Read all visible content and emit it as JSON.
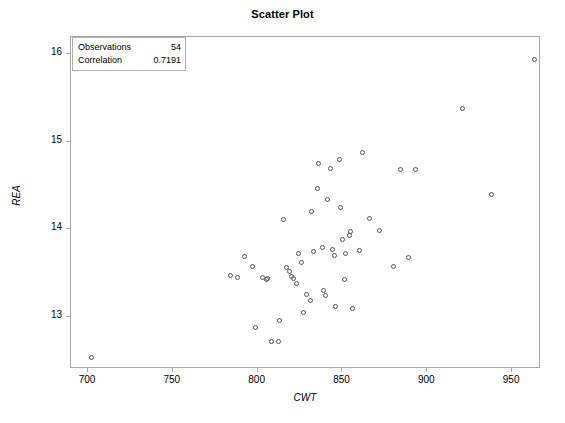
{
  "chart_data": {
    "type": "scatter",
    "title": "Scatter Plot",
    "xlabel": "CWT",
    "ylabel": "REA",
    "xlim": [
      690,
      967
    ],
    "ylim": [
      12.4,
      16.2
    ],
    "xticks": [
      700,
      750,
      800,
      850,
      900,
      950
    ],
    "yticks": [
      13,
      14,
      15,
      16
    ],
    "xtick_labels": [
      "700",
      "750",
      "800",
      "850",
      "900",
      "950"
    ],
    "ytick_labels": [
      "13",
      "14",
      "15",
      "16"
    ],
    "grid": false,
    "legend_position": "top-left",
    "marker": "open-circle",
    "marker_color": "#555555",
    "frame_color": "#a8a8a8",
    "points": [
      {
        "x": 702,
        "y": 12.53
      },
      {
        "x": 784,
        "y": 13.47
      },
      {
        "x": 788,
        "y": 13.45
      },
      {
        "x": 792,
        "y": 13.69
      },
      {
        "x": 797,
        "y": 13.57
      },
      {
        "x": 799,
        "y": 12.88
      },
      {
        "x": 803,
        "y": 13.45
      },
      {
        "x": 805,
        "y": 13.42
      },
      {
        "x": 806,
        "y": 13.44
      },
      {
        "x": 808,
        "y": 12.71
      },
      {
        "x": 812,
        "y": 12.72
      },
      {
        "x": 813,
        "y": 12.95
      },
      {
        "x": 815,
        "y": 14.11
      },
      {
        "x": 817,
        "y": 13.56
      },
      {
        "x": 819,
        "y": 13.52
      },
      {
        "x": 820,
        "y": 13.46
      },
      {
        "x": 821,
        "y": 13.44
      },
      {
        "x": 823,
        "y": 13.38
      },
      {
        "x": 824,
        "y": 13.72
      },
      {
        "x": 826,
        "y": 13.62
      },
      {
        "x": 827,
        "y": 13.05
      },
      {
        "x": 829,
        "y": 13.25
      },
      {
        "x": 831,
        "y": 13.18
      },
      {
        "x": 832,
        "y": 14.2
      },
      {
        "x": 833,
        "y": 13.74
      },
      {
        "x": 835,
        "y": 14.47
      },
      {
        "x": 836,
        "y": 14.75
      },
      {
        "x": 838,
        "y": 13.79
      },
      {
        "x": 839,
        "y": 13.3
      },
      {
        "x": 840,
        "y": 13.24
      },
      {
        "x": 841,
        "y": 14.34
      },
      {
        "x": 843,
        "y": 14.7
      },
      {
        "x": 844,
        "y": 13.77
      },
      {
        "x": 845,
        "y": 13.7
      },
      {
        "x": 846,
        "y": 13.12
      },
      {
        "x": 848,
        "y": 14.8
      },
      {
        "x": 849,
        "y": 14.25
      },
      {
        "x": 850,
        "y": 13.88
      },
      {
        "x": 851,
        "y": 13.43
      },
      {
        "x": 852,
        "y": 13.72
      },
      {
        "x": 854,
        "y": 13.93
      },
      {
        "x": 855,
        "y": 13.97
      },
      {
        "x": 856,
        "y": 13.09
      },
      {
        "x": 860,
        "y": 13.76
      },
      {
        "x": 862,
        "y": 14.88
      },
      {
        "x": 866,
        "y": 14.12
      },
      {
        "x": 872,
        "y": 13.98
      },
      {
        "x": 880,
        "y": 13.57
      },
      {
        "x": 884,
        "y": 14.68
      },
      {
        "x": 889,
        "y": 13.68
      },
      {
        "x": 893,
        "y": 14.68
      },
      {
        "x": 921,
        "y": 15.38
      },
      {
        "x": 938,
        "y": 14.4
      },
      {
        "x": 963,
        "y": 15.94
      }
    ]
  },
  "stats": {
    "observations_label": "Observations",
    "observations_value": "54",
    "correlation_label": "Correlation",
    "correlation_value": "0.7191"
  }
}
